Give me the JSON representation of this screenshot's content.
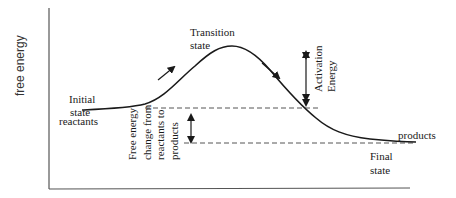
{
  "diagram": {
    "type": "energy-profile",
    "y_axis_label": "free energy",
    "labels": {
      "transition_state_line1": "Transition",
      "transition_state_line2": "state",
      "initial_state_line1": "Initial",
      "initial_state_line2": "state",
      "reactants": "reactants",
      "products": "products",
      "final_state_line1": "Final",
      "final_state_line2": "state",
      "activation_energy_line1": "Activation",
      "activation_energy_line2": "Energy",
      "free_energy_change_line1": "Free energy",
      "free_energy_change_line2": "change from",
      "free_energy_change_line3": "reactants to",
      "free_energy_change_line4": "products"
    },
    "colors": {
      "line": "#1a1a1a",
      "axis": "#555555",
      "dashed": "#555555",
      "background": "#ffffff"
    }
  }
}
